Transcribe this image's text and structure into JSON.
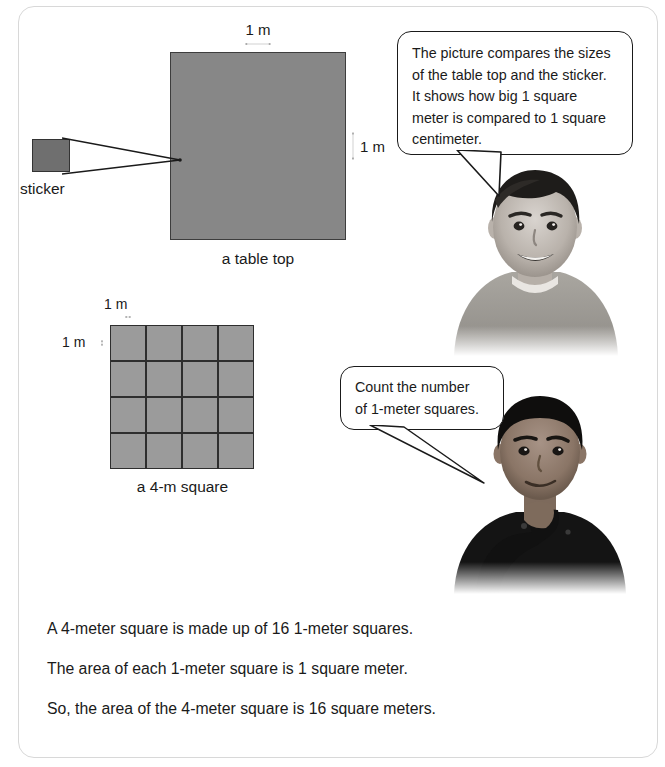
{
  "figure_tabletop": {
    "caption": "a table top",
    "width_label": "1 m",
    "height_label": "1 m",
    "fill_color": "#878787",
    "stroke_color": "#3d3d3d"
  },
  "figure_sticker": {
    "caption": "sticker",
    "fill_color": "#6f6f6f",
    "stroke_color": "#333333"
  },
  "figure_grid": {
    "caption": "a 4-m square",
    "cell_width_label": "1 m",
    "cell_height_label": "1 m",
    "rows": 4,
    "cols": 4,
    "total_cells": 16,
    "cell_fill_color": "#9b9b9b",
    "line_color": "#2e2e2e"
  },
  "bubbles": [
    {
      "id": "bubble-1",
      "text": "The picture compares the sizes\nof the table top and the sticker.\nIt shows how big 1 square\nmeter is compared to 1 square\ncentimeter."
    },
    {
      "id": "bubble-2",
      "text": "Count the number\nof 1-meter squares."
    }
  ],
  "photos": [
    {
      "id": "photo-boy-1",
      "alt": "smiling boy in light sweater"
    },
    {
      "id": "photo-boy-2",
      "alt": "boy resting chin on hand"
    }
  ],
  "bottom_text": {
    "lines": [
      "A 4-meter square is made up of 16 1-meter squares.",
      "The area of each 1-meter square is 1 square meter.",
      "So, the area of the 4-meter square is 16 square meters."
    ]
  }
}
